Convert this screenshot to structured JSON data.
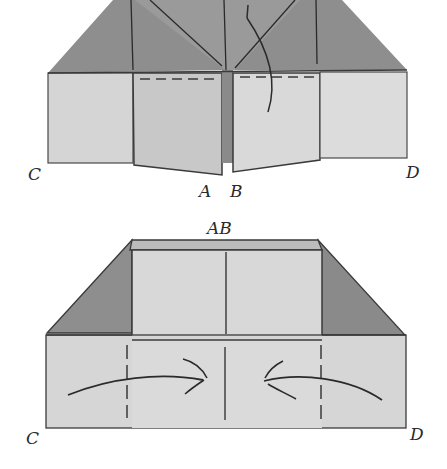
{
  "diagram": {
    "type": "origami-fold-steps",
    "colors": {
      "dark_paper": "#8c8c8c",
      "mid_paper": "#b0b0b0",
      "light_paper": "#d6d6d6",
      "lighter_paper": "#dcdcdc",
      "line": "#3a3a3a",
      "background": "#ffffff"
    },
    "step1": {
      "labels": {
        "left_corner": "C",
        "right_corner": "D",
        "center_left": "A",
        "center_right": "B"
      },
      "fold_lines": [
        "dashed valley folds on inner flaps",
        "curved arrow folding flap down"
      ]
    },
    "step2": {
      "top_label": "AB",
      "labels": {
        "left_corner": "C",
        "right_corner": "D"
      },
      "fold_lines": [
        "dashed vertical folds",
        "two curved arrows pointing to center"
      ]
    }
  }
}
